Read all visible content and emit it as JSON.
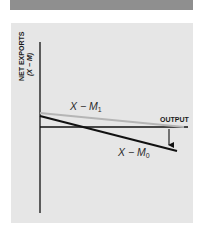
{
  "figure": {
    "y_axis_label_line1": "NET EXPORTS",
    "y_axis_label_line2": "(X − M)",
    "x_axis_label": "OUTPUT",
    "curves": [
      {
        "name": "X − M",
        "subscript": "1",
        "color": "#b5b5b5",
        "description": "original net exports schedule"
      },
      {
        "name": "X − M",
        "subscript": "0",
        "color": "#111111",
        "description": "shifted net exports schedule"
      }
    ],
    "shift_arrow": "downward shift",
    "colors": {
      "header_bar": "#8f8f8f",
      "panel_background": "#e6e6e6",
      "axis": "#111111"
    }
  }
}
